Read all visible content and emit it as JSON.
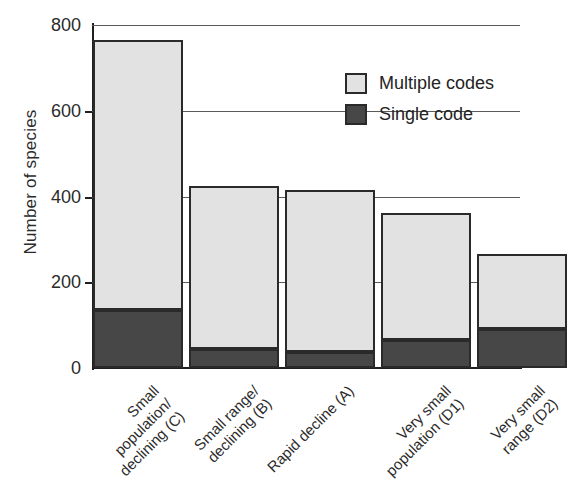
{
  "chart_data": {
    "type": "bar",
    "subtype": "stacked-vertical",
    "title": "",
    "xlabel": "",
    "ylabel": "Number of species",
    "ylim": [
      0,
      800
    ],
    "yticks": [
      0,
      200,
      400,
      600,
      800
    ],
    "ytick_labels": [
      "0",
      "200",
      "400",
      "600",
      "800"
    ],
    "grid": "horizontal",
    "legend_position": "top-right",
    "categories": [
      "Small population/ declining (C)",
      "Small range/ declining (B)",
      "Rapid decline (A)",
      "Very small population (D1)",
      "Very small range (D2)"
    ],
    "category_lines": [
      [
        "Small",
        "population/",
        "declining (C)"
      ],
      [
        "Small range/",
        "declining (B)",
        ""
      ],
      [
        "Rapid decline (A)",
        "",
        ""
      ],
      [
        "Very small",
        "population (D1)",
        ""
      ],
      [
        "Very small",
        "range (D2)",
        ""
      ]
    ],
    "series": [
      {
        "name": "Single code",
        "color": "#474747",
        "values": [
          135,
          45,
          38,
          65,
          90
        ]
      },
      {
        "name": "Multiple codes",
        "color": "#e2e2e2",
        "values": [
          630,
          380,
          377,
          297,
          175
        ]
      }
    ],
    "totals": [
      765,
      425,
      415,
      362,
      265
    ]
  },
  "legend": {
    "items": [
      {
        "label": "Multiple codes",
        "swatch": "multiple"
      },
      {
        "label": "Single code",
        "swatch": "single"
      }
    ]
  },
  "colors": {
    "multiple_codes": "#e2e2e2",
    "single_code": "#474747",
    "axis": "#1f1f1f",
    "gridline": "#5a5a5a",
    "text": "#2b2b2b",
    "background": "#ffffff"
  }
}
